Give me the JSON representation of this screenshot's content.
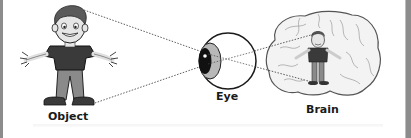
{
  "diagram": {
    "labels": {
      "object": "Object",
      "eye": "Eye",
      "brain": "Brain"
    },
    "nodes": [
      {
        "id": "object",
        "icon": "person-figure-icon",
        "label": "Object"
      },
      {
        "id": "eye",
        "icon": "eyeball-icon",
        "label": "Eye"
      },
      {
        "id": "brain",
        "icon": "brain-icon",
        "label": "Brain",
        "contains": "small-person-figure-icon"
      }
    ],
    "connections": [
      {
        "from": "object-head",
        "to": "eye-pupil",
        "style": "dotted"
      },
      {
        "from": "object-feet",
        "to": "eye-pupil",
        "style": "dotted"
      },
      {
        "from": "eye-pupil",
        "to": "brain-person-feet",
        "style": "dotted"
      },
      {
        "from": "eye-pupil",
        "to": "brain-person-head",
        "style": "dotted"
      }
    ],
    "colors": {
      "border": "#8c8c8c",
      "line": "#333333",
      "shirt": "#3a3a3a",
      "pants": "#8a8a8a",
      "skin": "#e6e6e6",
      "brain_fill": "#f2f2f2"
    }
  }
}
